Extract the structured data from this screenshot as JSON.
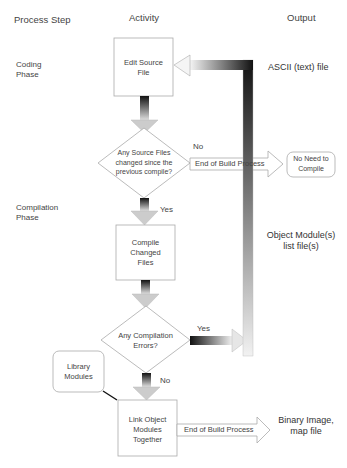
{
  "headers": {
    "process_step": "Process Step",
    "activity": "Activity",
    "output": "Output"
  },
  "phases": {
    "coding": [
      "Coding",
      "Phase"
    ],
    "compilation": [
      "Compilation",
      "Phase"
    ]
  },
  "nodes": {
    "edit_source": [
      "Edit Source",
      "File"
    ],
    "decision_changed": [
      "Any Source Files",
      "changed since the",
      "previous compile?"
    ],
    "compile": [
      "Compile",
      "Changed",
      "Files"
    ],
    "decision_errors": [
      "Any Compilation",
      "Errors?"
    ],
    "library": [
      "Library",
      "Modules"
    ],
    "link": [
      "Link Object",
      "Modules",
      "Together"
    ],
    "no_need": [
      "No Need to",
      "Compile"
    ]
  },
  "edges": {
    "no_label": "No",
    "yes_label_1": "Yes",
    "yes_label_2": "Yes",
    "no_label_2": "No",
    "end_build_1": "End of Build Process",
    "end_build_2": "End of Build Process"
  },
  "outputs": {
    "ascii": "ASCII (text) file",
    "object": [
      "Object Module(s)",
      "list file(s)"
    ],
    "binary": [
      "Binary Image,",
      "map file"
    ]
  },
  "colors": {
    "arrow_dark": "#111111",
    "arrow_light": "#f2f2f2",
    "box_border": "#aaaaaa"
  }
}
